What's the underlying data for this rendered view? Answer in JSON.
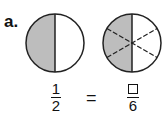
{
  "problem_label": "a.",
  "left_circle": {
    "parts": 2,
    "shaded": 1,
    "fill": "#bdbdbd"
  },
  "right_circle": {
    "parts": 6,
    "shaded": 3,
    "fill": "#bdbdbd",
    "dividers": "dashed"
  },
  "equation": {
    "left": {
      "numerator": "1",
      "denominator": "2"
    },
    "operator": "=",
    "right": {
      "numerator": "□",
      "denominator": "6"
    }
  }
}
